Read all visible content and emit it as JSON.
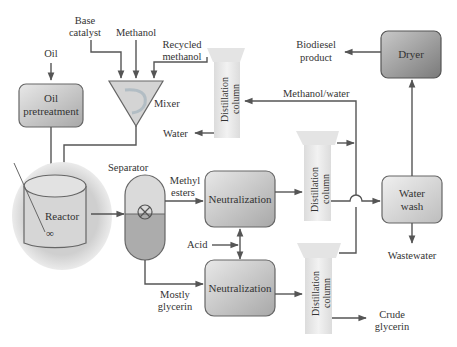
{
  "diagram": {
    "colors": {
      "line": "#555555",
      "box_light": "#e6e6e6",
      "box_mid": "#c4c4c4",
      "box_dark": "#8e8e8e",
      "column_fill": "#e9e9e9",
      "text": "#333333"
    },
    "inputs": {
      "oil": "Oil",
      "base_catalyst_1": "Base",
      "base_catalyst_2": "catalyst",
      "methanol": "Methanol",
      "recycled_methanol_1": "Recycled",
      "recycled_methanol_2": "methanol",
      "acid": "Acid"
    },
    "units": {
      "oil_pretreatment_1": "Oil",
      "oil_pretreatment_2": "pretreatment",
      "mixer": "Mixer",
      "reactor": "Reactor",
      "separator": "Separator",
      "neutralization_top": "Neutralization",
      "neutralization_bottom": "Neutralization",
      "distillation_column_1": "Distillation",
      "distillation_column_2": "column",
      "water_wash_1": "Water",
      "water_wash_2": "wash",
      "dryer": "Dryer"
    },
    "streams": {
      "water": "Water",
      "methanol_water": "Methanol/water",
      "methyl_esters_1": "Methyl",
      "methyl_esters_2": "esters",
      "mostly_glycerin_1": "Mostly",
      "mostly_glycerin_2": "glycerin"
    },
    "outputs": {
      "biodiesel_product_1": "Biodiesel",
      "biodiesel_product_2": "product",
      "wastewater": "Wastewater",
      "crude_glycerin_1": "Crude",
      "crude_glycerin_2": "glycerin"
    },
    "nodes": [
      {
        "id": "oil_pretreatment",
        "type": "process"
      },
      {
        "id": "mixer",
        "type": "mixer"
      },
      {
        "id": "reactor",
        "type": "vessel"
      },
      {
        "id": "separator",
        "type": "separator"
      },
      {
        "id": "distillation_top",
        "type": "column"
      },
      {
        "id": "neutralization_top",
        "type": "process"
      },
      {
        "id": "neutralization_bottom",
        "type": "process"
      },
      {
        "id": "distillation_mid",
        "type": "column"
      },
      {
        "id": "distillation_bottom",
        "type": "column"
      },
      {
        "id": "water_wash",
        "type": "process"
      },
      {
        "id": "dryer",
        "type": "process"
      }
    ],
    "edges": [
      {
        "from": "Oil",
        "to": "oil_pretreatment"
      },
      {
        "from": "Base catalyst",
        "to": "mixer"
      },
      {
        "from": "Methanol",
        "to": "mixer"
      },
      {
        "from": "distillation_top",
        "to": "mixer",
        "label": "Recycled methanol"
      },
      {
        "from": "distillation_top",
        "to": "Water"
      },
      {
        "from": "oil_pretreatment",
        "to": "reactor"
      },
      {
        "from": "mixer",
        "to": "reactor"
      },
      {
        "from": "reactor",
        "to": "separator"
      },
      {
        "from": "separator",
        "to": "neutralization_top",
        "label": "Methyl esters"
      },
      {
        "from": "separator",
        "to": "neutralization_bottom",
        "label": "Mostly glycerin"
      },
      {
        "from": "Acid",
        "to": "neutralization_top"
      },
      {
        "from": "Acid",
        "to": "neutralization_bottom"
      },
      {
        "from": "neutralization_top",
        "to": "distillation_mid"
      },
      {
        "from": "neutralization_bottom",
        "to": "distillation_bottom"
      },
      {
        "from": "distillation_mid",
        "to": "water_wash"
      },
      {
        "from": "distillation_mid",
        "to": "distillation_top",
        "label": "Methanol/water"
      },
      {
        "from": "distillation_bottom",
        "to": "distillation_top",
        "label": "Methanol/water"
      },
      {
        "from": "distillation_bottom",
        "to": "Crude glycerin"
      },
      {
        "from": "water_wash",
        "to": "dryer"
      },
      {
        "from": "water_wash",
        "to": "Wastewater"
      },
      {
        "from": "dryer",
        "to": "Biodiesel product"
      }
    ]
  }
}
